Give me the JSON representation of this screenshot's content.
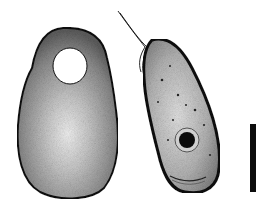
{
  "figure": {
    "background_color": "#ffffff",
    "colors": {
      "outline": "#111111",
      "cytoplasm_dark": "#6a6a6a",
      "cytoplasm_light": "#d8d8d8",
      "nucleus": "#0a0a0a"
    },
    "cells": [
      {
        "id": "left-cell",
        "shape": "ovoid",
        "features": [
          "vacuole",
          "light-central-region"
        ]
      },
      {
        "id": "right-cell",
        "shape": "curved-elongate",
        "features": [
          "flagella",
          "nucleus",
          "stippling"
        ]
      }
    ],
    "scale_bar": {
      "orientation": "vertical",
      "label": ""
    }
  }
}
